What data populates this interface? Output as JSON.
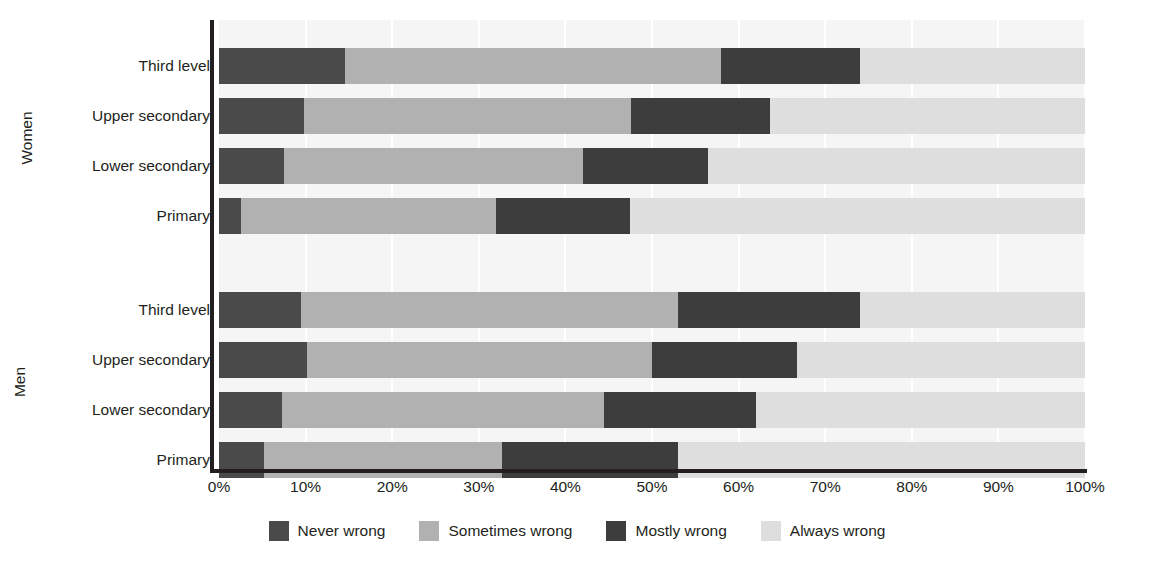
{
  "chart_data": {
    "type": "bar",
    "orientation": "horizontal",
    "stacked": true,
    "normalized_percent": true,
    "title": "",
    "xlabel": "",
    "ylabel": "",
    "xlim": [
      0,
      100
    ],
    "grid": true,
    "legend_position": "bottom",
    "xticks": [
      {
        "value": 0,
        "label": "0%"
      },
      {
        "value": 10,
        "label": "10%"
      },
      {
        "value": 20,
        "label": "20%"
      },
      {
        "value": 30,
        "label": "30%"
      },
      {
        "value": 40,
        "label": "40%"
      },
      {
        "value": 50,
        "label": "50%"
      },
      {
        "value": 60,
        "label": "60%"
      },
      {
        "value": 70,
        "label": "70%"
      },
      {
        "value": 80,
        "label": "80%"
      },
      {
        "value": 90,
        "label": "90%"
      },
      {
        "value": 100,
        "label": "100%"
      }
    ],
    "series": [
      {
        "name": "Never wrong",
        "color": "#4a4a4a"
      },
      {
        "name": "Sometimes wrong",
        "color": "#b1b1b1"
      },
      {
        "name": "Mostly wrong",
        "color": "#3d3d3d"
      },
      {
        "name": "Always wrong",
        "color": "#dedede"
      }
    ],
    "groups": [
      {
        "name": "Women",
        "categories": [
          {
            "label": "Third level",
            "values": [
              14.5,
              43.5,
              16.0,
              26.0
            ]
          },
          {
            "label": "Upper secondary",
            "values": [
              9.8,
              37.8,
              16.0,
              36.4
            ]
          },
          {
            "label": "Lower secondary",
            "values": [
              7.5,
              34.5,
              14.5,
              43.5
            ]
          },
          {
            "label": "Primary",
            "values": [
              2.5,
              29.5,
              15.5,
              52.5
            ]
          }
        ]
      },
      {
        "name": "Men",
        "categories": [
          {
            "label": "Third level",
            "values": [
              9.5,
              43.5,
              21.0,
              26.0
            ]
          },
          {
            "label": "Upper secondary",
            "values": [
              10.2,
              39.8,
              16.7,
              33.3
            ]
          },
          {
            "label": "Lower secondary",
            "values": [
              7.3,
              37.2,
              17.5,
              38.0
            ]
          },
          {
            "label": "Primary",
            "values": [
              5.2,
              27.5,
              20.3,
              47.0
            ]
          }
        ]
      }
    ]
  },
  "axis_group_labels": [
    {
      "name": "Women"
    },
    {
      "name": "Men"
    }
  ],
  "legend": {
    "items": [
      {
        "label": "Never wrong",
        "color": "#4a4a4a"
      },
      {
        "label": "Sometimes wrong",
        "color": "#b1b1b1"
      },
      {
        "label": "Mostly wrong",
        "color": "#3d3d3d"
      },
      {
        "label": "Always wrong",
        "color": "#dedede"
      }
    ]
  },
  "colors": {
    "background": "#ffffff",
    "plot_background": "#f5f5f5",
    "axis": "#231f20",
    "text": "#231f20",
    "gridline": "#ffffff"
  }
}
